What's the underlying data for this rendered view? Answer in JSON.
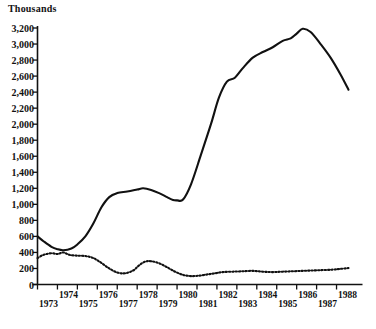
{
  "chart_data": {
    "type": "line",
    "title": "",
    "subtitle": "",
    "xlabel": "",
    "ylabel": "Thousands",
    "ylim": [
      0,
      3200
    ],
    "xlim": [
      1973,
      1988.6
    ],
    "grid": false,
    "legend": "none",
    "y_ticks": [
      0,
      200,
      400,
      600,
      800,
      1000,
      1200,
      1400,
      1600,
      1800,
      2000,
      2200,
      2400,
      2600,
      2800,
      3000,
      3200
    ],
    "y_tick_labels": [
      "0",
      "200",
      "400",
      "600",
      "800",
      "1,000",
      "1,200",
      "1,400",
      "1,600",
      "1,800",
      "2,000",
      "2,200",
      "2,400",
      "2,600",
      "2,800",
      "3,000",
      "3,200"
    ],
    "x_ticks": [
      1973,
      1974,
      1975,
      1976,
      1977,
      1978,
      1979,
      1980,
      1981,
      1982,
      1983,
      1984,
      1985,
      1986,
      1987,
      1988
    ],
    "x_tick_labels": [
      "1973",
      "1974",
      "1975",
      "1976",
      "1977",
      "1978",
      "1979",
      "1980",
      "1981",
      "1982",
      "1983",
      "1984",
      "1985",
      "1986",
      "1987",
      "1988"
    ],
    "series": [
      {
        "name": "solid-series",
        "style": "solid",
        "color": "#111111",
        "x": [
          1973.0,
          1973.3,
          1973.7,
          1974.0,
          1974.3,
          1974.7,
          1975.0,
          1975.4,
          1975.8,
          1976.2,
          1976.6,
          1977.0,
          1977.5,
          1978.0,
          1978.3,
          1978.7,
          1979.1,
          1979.5,
          1979.8,
          1980.0,
          1980.3,
          1980.7,
          1981.2,
          1981.7,
          1982.1,
          1982.5,
          1982.9,
          1983.3,
          1983.8,
          1984.3,
          1984.8,
          1985.3,
          1985.7,
          1986.0,
          1986.3,
          1986.7,
          1987.2,
          1987.7,
          1988.2,
          1988.6
        ],
        "y": [
          600,
          540,
          470,
          440,
          428,
          450,
          500,
          600,
          760,
          960,
          1090,
          1140,
          1160,
          1185,
          1200,
          1180,
          1140,
          1090,
          1055,
          1050,
          1060,
          1250,
          1620,
          2000,
          2330,
          2530,
          2580,
          2700,
          2830,
          2900,
          2960,
          3040,
          3070,
          3130,
          3190,
          3150,
          3000,
          2830,
          2620,
          2430
        ]
      },
      {
        "name": "dotted-series",
        "style": "dotted",
        "color": "#111111",
        "x": [
          1973.0,
          1973.3,
          1973.7,
          1974.0,
          1974.3,
          1974.6,
          1975.0,
          1975.4,
          1975.8,
          1976.2,
          1976.6,
          1977.0,
          1977.4,
          1977.8,
          1978.1,
          1978.4,
          1978.7,
          1979.1,
          1979.5,
          1979.9,
          1980.3,
          1980.7,
          1981.1,
          1981.5,
          1981.9,
          1982.3,
          1982.8,
          1983.3,
          1983.8,
          1984.3,
          1984.8,
          1985.3,
          1985.8,
          1986.3,
          1986.8,
          1987.3,
          1987.8,
          1988.2,
          1988.6
        ],
        "y": [
          330,
          370,
          390,
          380,
          400,
          370,
          360,
          355,
          330,
          270,
          200,
          150,
          140,
          175,
          240,
          285,
          290,
          265,
          215,
          160,
          120,
          105,
          110,
          125,
          140,
          155,
          160,
          165,
          170,
          160,
          155,
          160,
          165,
          170,
          175,
          180,
          185,
          195,
          205
        ]
      }
    ]
  },
  "axis": {
    "y_title": "Thousands"
  }
}
